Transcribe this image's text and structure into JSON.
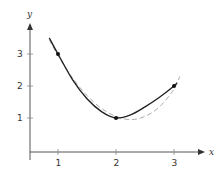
{
  "chart_data": {
    "type": "line",
    "title": "",
    "xlabel": "x",
    "ylabel": "y",
    "xlim": [
      0.5,
      3.5
    ],
    "ylim": [
      0,
      4
    ],
    "grid": false,
    "legend": null,
    "x_ticks": [
      1,
      2,
      3
    ],
    "y_ticks": [
      1,
      2,
      3
    ],
    "x_tick_labels": [
      "1",
      "2",
      "3"
    ],
    "y_tick_labels": [
      "1",
      "2",
      "3"
    ],
    "series": [
      {
        "name": "solid curve",
        "style": "solid",
        "color": "#222222",
        "x": [
          0.85,
          1.0,
          1.25,
          1.5,
          1.75,
          2.0,
          2.25,
          2.5,
          2.75,
          3.0,
          3.05
        ],
        "y": [
          3.5,
          3.0,
          2.2,
          1.6,
          1.2,
          1.0,
          1.1,
          1.35,
          1.65,
          2.0,
          2.1
        ]
      },
      {
        "name": "dashed approximation",
        "style": "dashed",
        "color": "#aaaaaa",
        "x": [
          0.85,
          1.0,
          1.25,
          1.5,
          1.75,
          2.0,
          2.25,
          2.5,
          2.75,
          3.0,
          3.1
        ],
        "y": [
          3.45,
          2.95,
          2.25,
          1.7,
          1.3,
          1.05,
          0.95,
          1.05,
          1.35,
          1.9,
          2.3
        ]
      }
    ],
    "points": [
      {
        "x": 1,
        "y": 3
      },
      {
        "x": 2,
        "y": 1
      },
      {
        "x": 3,
        "y": 2
      }
    ]
  }
}
